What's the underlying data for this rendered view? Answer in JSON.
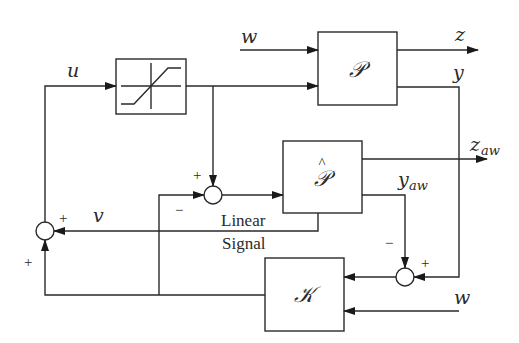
{
  "diagram": {
    "type": "block-diagram",
    "blocks": {
      "saturation": {
        "label": "",
        "icon": "saturation-nonlinearity-icon"
      },
      "plant": {
        "label": "𝒫"
      },
      "plant_model": {
        "label": "𝒫",
        "hat": "^"
      },
      "controller": {
        "label": "𝒦"
      }
    },
    "signals": {
      "u": "u",
      "w_top": "w",
      "z": "z",
      "y": "y",
      "z_aw_main": "z",
      "z_aw_sub": "aw",
      "y_aw_main": "y",
      "y_aw_sub": "aw",
      "v": "v",
      "w_bottom": "w"
    },
    "annotations": {
      "linear": "Linear",
      "signal": "Signal"
    },
    "signs": {
      "sum_mid_top": "+",
      "sum_mid_left": "−",
      "sum_left_top": "+",
      "sum_left_bottom": "+",
      "sum_right_top": "−",
      "sum_right_right": "+"
    }
  }
}
